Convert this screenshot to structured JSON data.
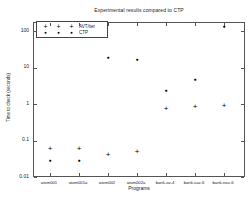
{
  "figure": {
    "background": "#ffffff",
    "axis_color": "#555555",
    "text_color": "#222222",
    "marker_color": "#000000"
  },
  "chart_data": {
    "type": "scatter",
    "title": "Experimental results compared to CTP",
    "xlabel": "Programs",
    "ylabel": "Time to check (seconds)",
    "y_scale": "log",
    "ylim": [
      0.01,
      200
    ],
    "grid": false,
    "legend_position": "top-left",
    "y_ticks": [
      "100",
      "10",
      "1",
      "0.1",
      "0.01"
    ],
    "y_tick_values": [
      100,
      10,
      1,
      0.1,
      0.01
    ],
    "categories": [
      "atom001",
      "atom001a",
      "atom002",
      "atom002a",
      "bank-av-4",
      "bank-sav-6",
      "bank-nav-6"
    ],
    "series": [
      {
        "name": "AVT/iter",
        "marker": "plus",
        "color": "#000000",
        "values": [
          0.06,
          0.06,
          0.04,
          0.05,
          0.75,
          0.85,
          0.9
        ]
      },
      {
        "name": "CTP",
        "marker": "dot",
        "color": "#000000",
        "values": [
          0.03,
          0.03,
          20,
          17,
          2.5,
          5,
          140
        ]
      }
    ]
  }
}
